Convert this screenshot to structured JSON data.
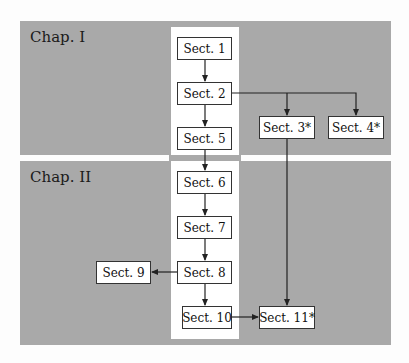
{
  "chapters": [
    {
      "label": "Chap. I"
    },
    {
      "label": "Chap. II"
    }
  ],
  "sections": {
    "s1": "Sect. 1",
    "s2": "Sect. 2",
    "s3": "Sect. 3*",
    "s4": "Sect. 4*",
    "s5": "Sect. 5",
    "s6": "Sect. 6",
    "s7": "Sect. 7",
    "s8": "Sect. 8",
    "s9": "Sect. 9",
    "s10": "Sect. 10",
    "s11": "Sect. 11*"
  },
  "edges": [
    [
      "Sect. 1",
      "Sect. 2"
    ],
    [
      "Sect. 2",
      "Sect. 5"
    ],
    [
      "Sect. 2",
      "Sect. 3*"
    ],
    [
      "Sect. 2",
      "Sect. 4*"
    ],
    [
      "Sect. 5",
      "Sect. 6"
    ],
    [
      "Sect. 3*",
      "Sect. 11*"
    ],
    [
      "Sect. 6",
      "Sect. 7"
    ],
    [
      "Sect. 7",
      "Sect. 8"
    ],
    [
      "Sect. 8",
      "Sect. 9"
    ],
    [
      "Sect. 8",
      "Sect. 10"
    ],
    [
      "Sect. 10",
      "Sect. 11*"
    ]
  ],
  "colors": {
    "chapter_bg": "#a9a9a9",
    "spine_bg": "#ffffff",
    "box_border": "#333333",
    "arrow": "#222222"
  }
}
